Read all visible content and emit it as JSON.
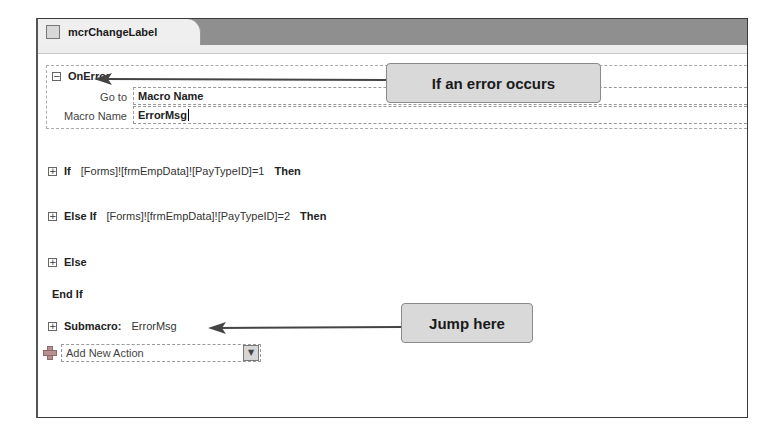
{
  "window": {
    "tab": {
      "title": "mcrChangeLabel",
      "icon": "macro-icon"
    }
  },
  "onerror": {
    "keyword": "OnError",
    "toggle": "⊟",
    "args": [
      {
        "label": "Go to",
        "value": "Macro Name"
      },
      {
        "label": "Macro Name",
        "value": "ErrorMsg"
      }
    ]
  },
  "blocks": [
    {
      "toggle": "⊞",
      "keyword": "If",
      "expression": "[Forms]![frmEmpData]![PayTypeID]=1",
      "suffix": "Then"
    },
    {
      "toggle": "⊞",
      "keyword": "Else If",
      "expression": "[Forms]![frmEmpData]![PayTypeID]=2",
      "suffix": "Then"
    },
    {
      "toggle": "⊞",
      "keyword": "Else"
    },
    {
      "keyword": "End If"
    },
    {
      "toggle": "⊞",
      "keyword": "Submacro:",
      "expression": "ErrorMsg"
    }
  ],
  "add_action": {
    "placeholder": "Add New Action",
    "dropdown_glyph": "▼"
  },
  "callouts": [
    {
      "text": "If an error occurs"
    },
    {
      "text": "Jump here"
    }
  ]
}
